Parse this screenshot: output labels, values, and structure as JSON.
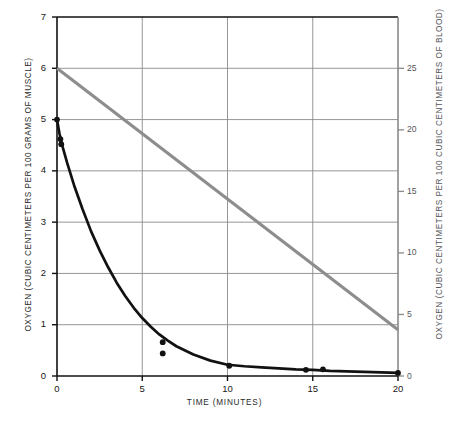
{
  "chart_data": {
    "type": "line",
    "title": "",
    "xlabel": "TIME (MINUTES)",
    "ylabel": "OXYGEN (CUBIC CENTIMETERS PER 100 GRAMS OF MUSCLE)",
    "y2label": "OXYGEN (CUBIC CENTIMETERS PER 100 CUBIC CENTIMETERS OF BLOOD)",
    "xlim": [
      0,
      20
    ],
    "ylim": [
      0,
      7
    ],
    "y2lim": [
      0,
      29.17
    ],
    "xticks": [
      0,
      5,
      10,
      15,
      20
    ],
    "xtick_labels": [
      "0",
      "5",
      "10",
      "15",
      "20"
    ],
    "yticks": [
      0,
      1,
      2,
      3,
      4,
      5,
      6,
      7
    ],
    "ytick_labels": [
      "0",
      "1",
      "2",
      "3",
      "4",
      "5",
      "6",
      "7"
    ],
    "y2ticks": [
      0,
      5,
      10,
      15,
      20,
      25
    ],
    "y2tick_labels": [
      "0",
      "5",
      "10",
      "15",
      "20",
      "25"
    ],
    "grid": true,
    "grid_color": "#8a8a8a",
    "legend": "none",
    "series": [
      {
        "name": "muscle-oxygen-decay",
        "axis": "left",
        "color": "#111111",
        "style": "curve-with-markers",
        "x": [
          0,
          0.15,
          0.3,
          0.6,
          1,
          1.5,
          2,
          2.5,
          3,
          3.5,
          4,
          4.5,
          5,
          5.5,
          6,
          6.5,
          7,
          8,
          9,
          10,
          11,
          12,
          13,
          14,
          15,
          16,
          17,
          18,
          19,
          20
        ],
        "values": [
          5.0,
          4.72,
          4.5,
          4.15,
          3.72,
          3.25,
          2.82,
          2.45,
          2.12,
          1.82,
          1.56,
          1.33,
          1.13,
          0.96,
          0.81,
          0.69,
          0.58,
          0.42,
          0.3,
          0.22,
          0.19,
          0.17,
          0.15,
          0.13,
          0.12,
          0.1,
          0.09,
          0.08,
          0.07,
          0.06
        ],
        "points": [
          {
            "x": 0.0,
            "y": 5.0
          },
          {
            "x": 0.2,
            "y": 4.62
          },
          {
            "x": 0.25,
            "y": 4.52
          },
          {
            "x": 6.2,
            "y": 0.66
          },
          {
            "x": 6.2,
            "y": 0.44
          },
          {
            "x": 10.1,
            "y": 0.2
          },
          {
            "x": 14.6,
            "y": 0.12
          },
          {
            "x": 15.6,
            "y": 0.13
          },
          {
            "x": 20.0,
            "y": 0.06
          }
        ]
      },
      {
        "name": "blood-oxygen-linear",
        "axis": "right",
        "color": "#8d8d8d",
        "style": "straight-line",
        "x": [
          0,
          20
        ],
        "values_left_scale": [
          6.0,
          0.9
        ],
        "values_right_scale": [
          25.0,
          3.75
        ]
      }
    ]
  },
  "axis_colors": {
    "left_axis": "#111111",
    "right_axis": "#8a8a8a",
    "frame": "#111111",
    "gridline": "#8a8a8a",
    "decay_curve": "#111111",
    "linear_line": "#8d8d8d"
  }
}
